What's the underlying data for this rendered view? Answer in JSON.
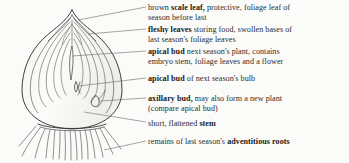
{
  "figure": {
    "subject": "bulb",
    "style": "pen-and-ink line drawing, scanned",
    "ink_color": "#3a3a3a",
    "paper_color": "#fbfbf9",
    "text_color": "#2b2b2b"
  },
  "labels": [
    {
      "id": "scale-leaf",
      "lead_in": "brown ",
      "term": "scale leaf,",
      "rest_line1": " protective, foliage leaf of",
      "line2": "season before last"
    },
    {
      "id": "fleshy-leaves",
      "lead_in": "",
      "term": "fleshy leaves",
      "rest_line1": " storing food, swollen bases of",
      "line2": "last season's foliage leaves"
    },
    {
      "id": "apical-bud-plant",
      "lead_in": "",
      "term": "apical bud",
      "rest_line1": " next season's plant, contains",
      "line2": "embryo stem, foliage leaves and a flower"
    },
    {
      "id": "apical-bud-bulb",
      "lead_in": "",
      "term": "apical bud",
      "rest_line1": " of next season's bulb",
      "line2": ""
    },
    {
      "id": "axillary-bud",
      "lead_in": "",
      "term": "axillary bud,",
      "rest_line1": " may also form a new plant",
      "line2": "(compare apical bud)"
    },
    {
      "id": "stem",
      "lead_in": "short, flattened ",
      "term": "stem",
      "rest_line1": "",
      "line2": ""
    },
    {
      "id": "adventitious-roots",
      "lead_in": "remains of last season's ",
      "term": "adventitious roots",
      "rest_line1": "",
      "line2": ""
    }
  ],
  "drawing_parts": [
    "bulb-outline",
    "neck-apex",
    "scale-leaf-layers",
    "fleshy-leaf-layers",
    "apical-bud-upper",
    "apical-bud-lower",
    "axillary-bud",
    "basal-plate-stem",
    "adventitious-roots"
  ]
}
